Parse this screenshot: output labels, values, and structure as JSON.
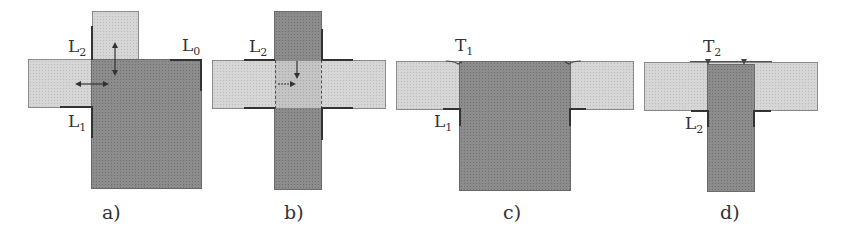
{
  "figure": {
    "panels": [
      {
        "id": "a",
        "caption": "a)",
        "labels": [
          {
            "text": "L",
            "sub": "2"
          },
          {
            "text": "L",
            "sub": "0"
          },
          {
            "text": "L",
            "sub": "1"
          }
        ]
      },
      {
        "id": "b",
        "caption": "b)",
        "labels": [
          {
            "text": "L",
            "sub": "2"
          }
        ]
      },
      {
        "id": "c",
        "caption": "c)",
        "labels": [
          {
            "text": "T",
            "sub": "1"
          },
          {
            "text": "L",
            "sub": "1"
          }
        ]
      },
      {
        "id": "d",
        "caption": "d)",
        "labels": [
          {
            "text": "T",
            "sub": "2"
          },
          {
            "text": "L",
            "sub": "2"
          }
        ]
      }
    ],
    "colors": {
      "light_fill": "#d6d6d6",
      "dark_fill": "#8c8c8c",
      "outline": "#333333"
    }
  }
}
